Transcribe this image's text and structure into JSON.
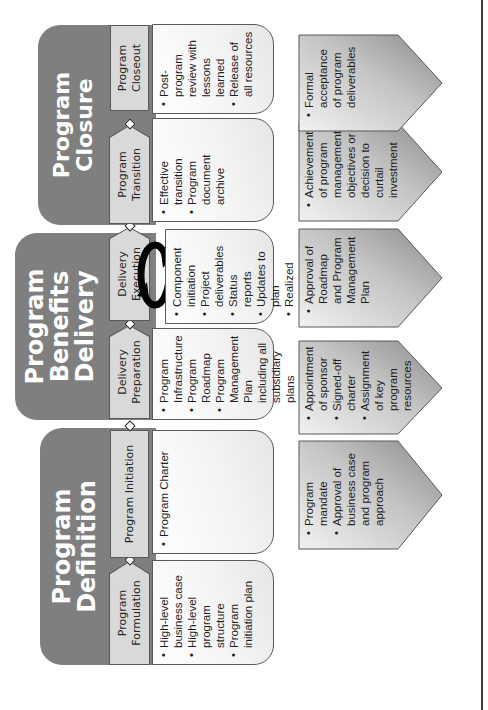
{
  "diagram": {
    "orientation": "rotated-90-ccw",
    "colors": {
      "phase_fill": "#7f7f7f",
      "subphase_fill": "#d9d9d9",
      "border": "#595959",
      "text": "#1f1f1f",
      "phase_title": "#ffffff"
    },
    "phases": [
      {
        "title": "Program Definition",
        "subphases": [
          {
            "label": "Program Formulation",
            "items": [
              "High-level business case",
              "High-level program structure",
              "Program initiation plan"
            ],
            "gate": [
              "Program mandate",
              "Approval of business case and program approach"
            ]
          },
          {
            "label": "Program Initiation",
            "items": [
              "Program Charter"
            ],
            "gate": [
              "Appointment of sponsor",
              "Signed-off charter",
              "Assignment of key program resources"
            ]
          }
        ]
      },
      {
        "title": "Program Benefits Delivery",
        "title_lines": [
          "Program",
          "Benefits",
          "Delivery"
        ],
        "subphases": [
          {
            "label": "Delivery Preparation",
            "items": [
              "Program Infrastructure",
              "Program Roadmap",
              "Program Management Plan including all subsidiary plans"
            ],
            "gate": [
              "Approval of Roadmap and Program Management Plan"
            ]
          },
          {
            "label": "Delivery Execution",
            "items": [
              "Component initiation",
              "Project deliverables",
              "Status reports",
              "Updates to plan",
              "Realized benefits",
              "Operational improvements"
            ],
            "gate": [
              "Achievement of program management objectives or decision to curtail investment"
            ],
            "icon": "cycle-arrows-icon"
          }
        ]
      },
      {
        "title": "Program Closure",
        "subphases": [
          {
            "label": "Program Transition",
            "items": [
              "Effective transition",
              "Program document archive"
            ],
            "gate": []
          },
          {
            "label": "Program Closeout",
            "items": [
              "Post-program review with lessons learned",
              "Release of all resources"
            ],
            "gate": [
              "Formal acceptance of program deliverables"
            ]
          }
        ]
      }
    ]
  }
}
